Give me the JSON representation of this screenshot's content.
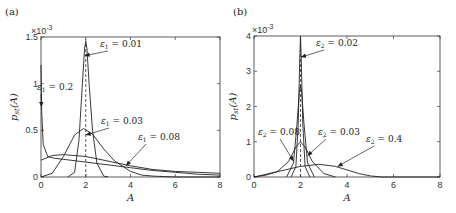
{
  "chart_data": [
    {
      "type": "line",
      "panel_label": "(a)",
      "title": "",
      "xlabel": "A",
      "ylabel": "p_st(A)",
      "y_multiplier": "×10^-3",
      "xlim": [
        0,
        8
      ],
      "ylim": [
        0,
        1.5
      ],
      "xticks": [
        "0",
        "2",
        "4",
        "6",
        "8"
      ],
      "yticks": [
        "0",
        "0.5",
        "1",
        "1.5"
      ],
      "grid": false,
      "reference_line": {
        "x": 2,
        "style": "dashed"
      },
      "series": [
        {
          "name": "ε1 = 0.01",
          "x": [
            1.2,
            1.5,
            1.7,
            1.85,
            1.95,
            2.0,
            2.05,
            2.15,
            2.3,
            2.5,
            2.8,
            3.0
          ],
          "y": [
            0.0,
            0.05,
            0.4,
            1.0,
            1.38,
            1.45,
            1.38,
            1.0,
            0.5,
            0.15,
            0.01,
            0.0
          ]
        },
        {
          "name": "ε1 = 0.03",
          "x": [
            0,
            0.5,
            1.0,
            1.5,
            1.9,
            2.3,
            2.8,
            3.3,
            4.0,
            4.5,
            5.0,
            6.0,
            8.0
          ],
          "y": [
            0.0,
            0.04,
            0.22,
            0.45,
            0.52,
            0.46,
            0.3,
            0.17,
            0.06,
            0.02,
            0.01,
            0.0,
            0.0
          ]
        },
        {
          "name": "ε1 = 0.08",
          "x": [
            0,
            0.5,
            1.0,
            2.0,
            3.0,
            4.0,
            5.0,
            6.0,
            7.0,
            8.0
          ],
          "y": [
            0.18,
            0.23,
            0.24,
            0.22,
            0.17,
            0.12,
            0.08,
            0.06,
            0.05,
            0.04
          ]
        },
        {
          "name": "ε1 = 0.2",
          "x": [
            0,
            0.03,
            0.1,
            0.3,
            0.6,
            1.0,
            2.0,
            3.0,
            4.0,
            5.0,
            6.0,
            7.0,
            8.0
          ],
          "y": [
            1.2,
            0.7,
            0.35,
            0.22,
            0.2,
            0.19,
            0.16,
            0.13,
            0.1,
            0.07,
            0.05,
            0.03,
            0.02
          ]
        }
      ],
      "annotations": [
        {
          "text": "ε1 = 0.01",
          "target": [
            1.95,
            1.3
          ]
        },
        {
          "text": "ε1 = 0.2",
          "target": [
            0.02,
            0.75
          ]
        },
        {
          "text": "ε1 = 0.03",
          "target": [
            2.0,
            0.45
          ]
        },
        {
          "text": "ε1 = 0.08",
          "target": [
            3.8,
            0.12
          ]
        }
      ]
    },
    {
      "type": "line",
      "panel_label": "(b)",
      "title": "",
      "xlabel": "A",
      "ylabel": "p_st(A)",
      "y_multiplier": "×10^-3",
      "xlim": [
        0,
        8
      ],
      "ylim": [
        0,
        4
      ],
      "xticks": [
        "0",
        "2",
        "4",
        "6",
        "8"
      ],
      "yticks": [
        "0",
        "1",
        "2",
        "3",
        "4"
      ],
      "grid": false,
      "reference_line": {
        "x": 2,
        "style": "dashed"
      },
      "series": [
        {
          "name": "ε2 = 0.02",
          "x": [
            1.6,
            1.8,
            1.9,
            1.97,
            2.0,
            2.03,
            2.1,
            2.2,
            2.4
          ],
          "y": [
            0.0,
            0.3,
            1.5,
            3.4,
            4.0,
            3.4,
            1.5,
            0.3,
            0.0
          ]
        },
        {
          "name": "ε2 = 0.03",
          "x": [
            1.4,
            1.7,
            1.85,
            1.95,
            2.0,
            2.05,
            2.15,
            2.3,
            2.6
          ],
          "y": [
            0.0,
            0.4,
            1.5,
            2.4,
            2.6,
            2.4,
            1.5,
            0.4,
            0.0
          ]
        },
        {
          "name": "ε2 = 0.08",
          "x": [
            0,
            0.5,
            1.0,
            1.5,
            1.8,
            2.0,
            2.2,
            2.5,
            3.0,
            3.5
          ],
          "y": [
            0.0,
            0.05,
            0.15,
            0.45,
            0.85,
            1.0,
            0.85,
            0.45,
            0.1,
            0.0
          ]
        },
        {
          "name": "ε2 = 0.4",
          "x": [
            0,
            1.0,
            2.0,
            2.8,
            3.5,
            4.0,
            4.5,
            5.0,
            5.5,
            8.0
          ],
          "y": [
            0.0,
            0.15,
            0.3,
            0.36,
            0.3,
            0.2,
            0.1,
            0.03,
            0.0,
            0.0
          ]
        }
      ],
      "annotations": [
        {
          "text": "ε2 = 0.02",
          "target": [
            2.02,
            3.4
          ]
        },
        {
          "text": "ε2 = 0.08",
          "target": [
            1.7,
            0.45
          ]
        },
        {
          "text": "ε2 = 0.03",
          "target": [
            2.3,
            0.6
          ]
        },
        {
          "text": "ε2 = 0.4",
          "target": [
            3.6,
            0.3
          ]
        }
      ]
    }
  ]
}
